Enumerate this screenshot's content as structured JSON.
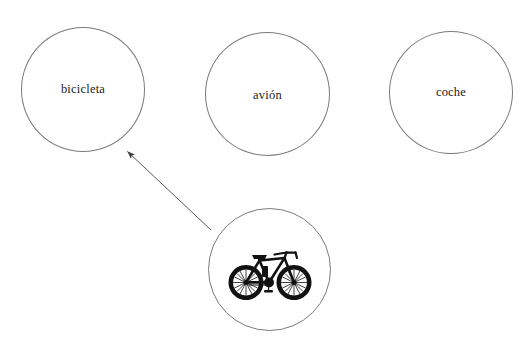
{
  "canvas": {
    "width": 528,
    "height": 338,
    "background_color": "#ffffff"
  },
  "exercise": {
    "type": "matching-diagram",
    "language": "es",
    "stroke_color": "#7a7a7a",
    "text_color": "#1a1a1a",
    "artwork_color": "#111111"
  },
  "word_circles": [
    {
      "id": "bicicleta",
      "label": "bicicleta",
      "cx": 83,
      "cy": 90,
      "r": 62,
      "matched": true
    },
    {
      "id": "avion",
      "label": "avión",
      "cx": 267,
      "cy": 94,
      "r": 62,
      "matched": false
    },
    {
      "id": "coche",
      "label": "coche",
      "cx": 451,
      "cy": 93,
      "r": 62,
      "matched": false
    }
  ],
  "image_circle": {
    "id": "bicycle-image",
    "icon": "bicycle-icon",
    "label": "",
    "cx": 269,
    "cy": 269,
    "r": 61
  },
  "connector": {
    "id": "match-arrow",
    "from": "bicycle-image",
    "to": "bicicleta",
    "start_x": 211,
    "start_y": 230,
    "end_x": 124,
    "end_y": 149,
    "arrowhead": "solid-triangle",
    "stroke_color": "#555555",
    "stroke_width": 1
  }
}
